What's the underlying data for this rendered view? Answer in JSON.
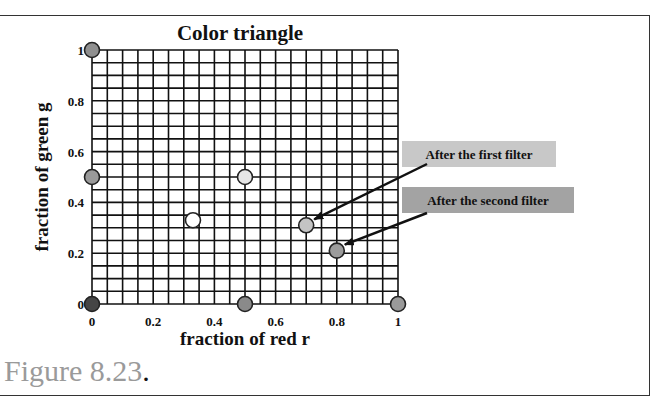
{
  "figure": {
    "caption_text": "Figure 8.23",
    "caption_period": "."
  },
  "chart_data": {
    "type": "scatter",
    "title": "Color triangle",
    "xlabel": "fraction of red r",
    "ylabel": "fraction of green g",
    "xlim": [
      0,
      1
    ],
    "ylim": [
      0,
      1
    ],
    "grid": true,
    "grid_step": 0.05,
    "xticks": [
      "0",
      "0.2",
      "0.4",
      "0.6",
      "0.8",
      "1"
    ],
    "yticks": [
      "0",
      "0.2",
      "0.4",
      "0.6",
      "0.8",
      "1"
    ],
    "points": [
      {
        "name": "green-primary",
        "r": 0,
        "g": 1,
        "color": "#909090"
      },
      {
        "name": "green-red-mix",
        "r": 0,
        "g": 0.5,
        "color": "#9a9a9a"
      },
      {
        "name": "blue-primary",
        "r": 0,
        "g": 0,
        "color": "#454545"
      },
      {
        "name": "red-blue-mix",
        "r": 0.5,
        "g": 0,
        "color": "#8a8a8a"
      },
      {
        "name": "red-primary",
        "r": 1,
        "g": 0,
        "color": "#9a9a9a"
      },
      {
        "name": "red-green-mix",
        "r": 0.5,
        "g": 0.5,
        "color": "#e6e6e6"
      },
      {
        "name": "white-point",
        "r": 0.33,
        "g": 0.33,
        "color": "#ffffff"
      },
      {
        "name": "after-first-filter",
        "r": 0.7,
        "g": 0.31,
        "color": "#c4c4c4"
      },
      {
        "name": "after-second-filter",
        "r": 0.8,
        "g": 0.21,
        "color": "#9c9c9c"
      }
    ],
    "annotations": [
      {
        "text": "After the first filter",
        "target": "after-first-filter",
        "box_color": "#c8c8c8"
      },
      {
        "text": "After the second filter",
        "target": "after-second-filter",
        "box_color": "#a3a3a3"
      }
    ]
  }
}
